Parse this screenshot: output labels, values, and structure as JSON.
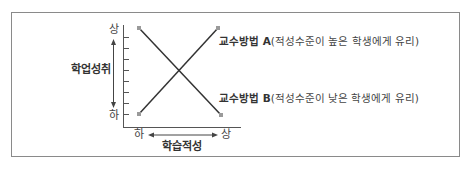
{
  "diagram": {
    "y_axis": {
      "label": "학업성취",
      "top": "상",
      "bottom": "하"
    },
    "x_axis": {
      "label": "학습적성",
      "left": "하",
      "right": "상"
    },
    "series": [
      {
        "name": "교수방법 A",
        "desc": "(적성수준이 높은 학생에게 유리)",
        "from": "하-하",
        "to": "상-상"
      },
      {
        "name": "교수방법 B",
        "desc": "(적성수준이 낮은 학생에게 유리)",
        "from": "하-상",
        "to": "상-하"
      }
    ],
    "colors": {
      "line": "#333333",
      "marker": "#9a9a9a",
      "border": "#8a8a8a"
    }
  }
}
